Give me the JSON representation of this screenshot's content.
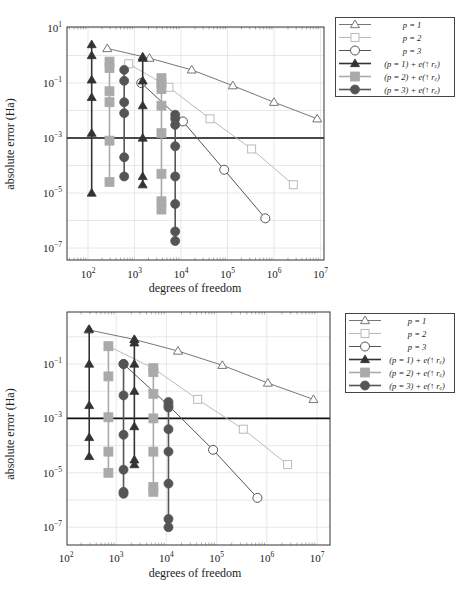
{
  "figures": [
    {
      "xlabel": "degrees of freedom",
      "ylabel": "absolute error (Ha)",
      "xticks": [
        "10^2",
        "10^3",
        "10^4",
        "10^5",
        "10^6",
        "10^7"
      ],
      "yticks": [
        "10^1",
        "10^-1",
        "10^-3",
        "10^-5",
        "10^-7"
      ],
      "legend": [
        {
          "label": "p = 1"
        },
        {
          "label": "p = 2"
        },
        {
          "label": "p = 3"
        },
        {
          "label": "(p = 1) + e(↑ r_e)"
        },
        {
          "label": "(p = 2) + e(↑ r_e)"
        },
        {
          "label": "(p = 3) + e(↑ r_e)"
        }
      ]
    },
    {
      "xlabel": "degrees of freedom",
      "ylabel": "absolute error (Ha)",
      "xticks": [
        "10^2",
        "10^3",
        "10^4",
        "10^5",
        "10^6",
        "10^7"
      ],
      "yticks": [
        "10^-1",
        "10^-3",
        "10^-5",
        "10^-7"
      ],
      "legend": [
        {
          "label": "p = 1"
        },
        {
          "label": "p = 2"
        },
        {
          "label": "p = 3"
        },
        {
          "label": "(p = 1) + e(↑ r_e)"
        },
        {
          "label": "(p = 2) + e(↑ r_e)"
        },
        {
          "label": "(p = 3) + e(↑ r_e)"
        }
      ]
    }
  ],
  "chart_data": [
    {
      "type": "line",
      "title": "",
      "xlabel": "degrees of freedom",
      "ylabel": "absolute error (Ha)",
      "xscale": "log",
      "yscale": "log",
      "xlim": [
        40,
        12000000
      ],
      "ylim": [
        1e-07,
        10
      ],
      "grid": true,
      "legend_position": "outside right",
      "reference_line": {
        "y": 0.001,
        "color": "#111111"
      },
      "series": [
        {
          "name": "p = 1",
          "marker": "open-triangle",
          "color": "#777777",
          "x": [
            260,
            2100,
            17000,
            130000,
            1000000,
            8500000
          ],
          "y": [
            1.8,
            0.8,
            0.3,
            0.08,
            0.02,
            0.005
          ]
        },
        {
          "name": "p = 2",
          "marker": "open-square",
          "color": "#bbbbbb",
          "x": [
            750,
            5500,
            42000,
            330000,
            2600000
          ],
          "y": [
            0.5,
            0.07,
            0.005,
            0.0004,
            2e-05
          ]
        },
        {
          "name": "p = 3",
          "marker": "open-circle",
          "color": "#555555",
          "x": [
            1400,
            11000,
            85000,
            650000
          ],
          "y": [
            0.1,
            0.004,
            7e-05,
            1.2e-06
          ]
        },
        {
          "name": "(p = 1) + e(↑ r_e)",
          "marker": "filled-triangle",
          "color": "#333333",
          "groups": [
            {
              "x": 120,
              "y": [
                2.5,
                1.0,
                0.13,
                0.03,
                0.0015,
                1e-05
              ]
            },
            {
              "x": 1500,
              "y": [
                0.9,
                0.8,
                0.12,
                0.015,
                0.001,
                4e-05,
                2e-05
              ]
            }
          ]
        },
        {
          "name": "(p = 2) + e(↑ r_e)",
          "marker": "filled-square",
          "color": "#aaaaaa",
          "groups": [
            {
              "x": 290,
              "y": [
                0.6,
                0.35,
                0.05,
                0.02,
                0.0008,
                2.5e-05
              ]
            },
            {
              "x": 3800,
              "y": [
                0.15,
                0.1,
                0.06,
                0.015,
                0.0015,
                5e-05,
                5e-06,
                2.5e-06
              ]
            }
          ]
        },
        {
          "name": "(p = 3) + e(↑ r_e)",
          "marker": "filled-circle",
          "color": "#555555",
          "groups": [
            {
              "x": 600,
              "y": [
                0.3,
                0.12,
                0.02,
                0.008,
                0.0002,
                4e-05
              ]
            },
            {
              "x": 7500,
              "y": [
                0.007,
                0.005,
                0.003,
                0.0005,
                4e-05,
                4e-06,
                4e-07,
                1.8e-07
              ]
            }
          ]
        }
      ]
    },
    {
      "type": "line",
      "title": "",
      "xlabel": "degrees of freedom",
      "ylabel": "absolute error (Ha)",
      "xscale": "log",
      "yscale": "log",
      "xlim": [
        100,
        12000000
      ],
      "ylim": [
        5e-08,
        5
      ],
      "grid": true,
      "legend_position": "outside right",
      "reference_line": {
        "y": 0.001,
        "color": "#111111"
      },
      "series": [
        {
          "name": "p = 1",
          "marker": "open-triangle",
          "color": "#777777",
          "x": [
            280,
            2300,
            17000,
            130000,
            1050000,
            8500000
          ],
          "y": [
            1.8,
            0.8,
            0.3,
            0.09,
            0.02,
            0.005
          ]
        },
        {
          "name": "p = 2",
          "marker": "open-square",
          "color": "#bbbbbb",
          "x": [
            700,
            5500,
            42000,
            340000,
            2600000
          ],
          "y": [
            0.45,
            0.07,
            0.005,
            0.0004,
            2e-05
          ]
        },
        {
          "name": "p = 3",
          "marker": "open-circle",
          "color": "#555555",
          "x": [
            1400,
            11000,
            85000,
            650000
          ],
          "y": [
            0.1,
            0.003,
            7e-05,
            1.2e-06
          ]
        },
        {
          "name": "(p = 1) + e(↑ r_e)",
          "marker": "filled-triangle",
          "color": "#333333",
          "groups": [
            {
              "x": 290,
              "y": [
                1.9,
                0.1,
                0.003,
                0.0002,
                4e-05
              ]
            },
            {
              "x": 2300,
              "y": [
                0.8,
                0.6,
                0.1,
                0.01,
                0.0005,
                3e-05,
                2e-05
              ]
            }
          ]
        },
        {
          "name": "(p = 2) + e(↑ r_e)",
          "marker": "filled-square",
          "color": "#aaaaaa",
          "groups": [
            {
              "x": 700,
              "y": [
                0.45,
                0.035,
                0.0011,
                6e-05,
                1e-05
              ]
            },
            {
              "x": 5500,
              "y": [
                0.07,
                0.05,
                0.008,
                0.001,
                6e-05,
                3e-06,
                2e-06
              ]
            }
          ]
        },
        {
          "name": "(p = 3) + e(↑ r_e)",
          "marker": "filled-circle",
          "color": "#555555",
          "groups": [
            {
              "x": 1400,
              "y": [
                0.1,
                0.007,
                0.00025,
                1.3e-05,
                2e-06,
                1.7e-06
              ]
            },
            {
              "x": 11000,
              "y": [
                0.004,
                0.0025,
                0.0004,
                6e-05,
                4e-06,
                2e-07,
                1e-07
              ]
            }
          ]
        }
      ]
    }
  ]
}
